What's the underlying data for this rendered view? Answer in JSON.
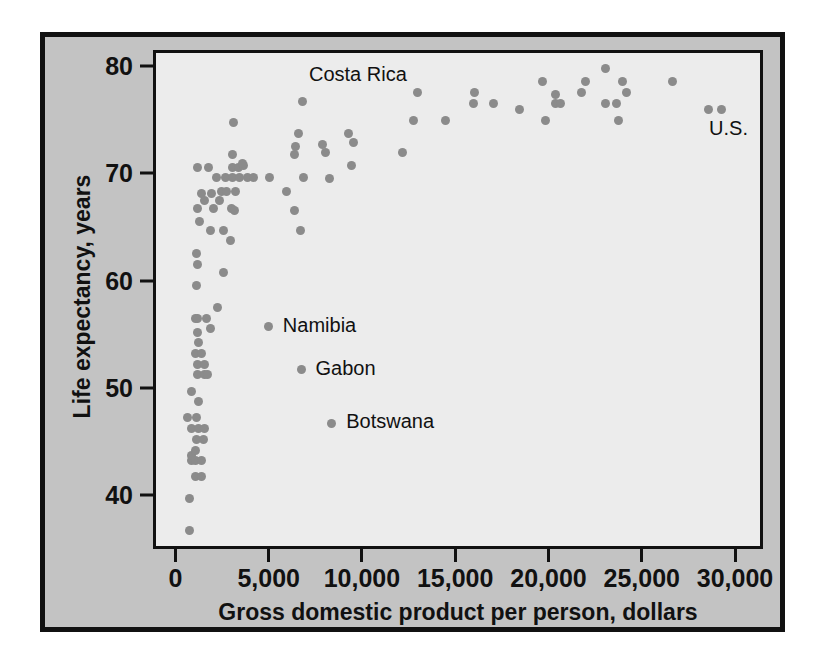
{
  "chart_data": {
    "type": "scatter",
    "title": "",
    "xlabel": "Gross domestic product per person, dollars",
    "ylabel": "Life expectancy, years",
    "xlim": [
      -1200,
      31500
    ],
    "ylim": [
      35.0,
      81.5
    ],
    "xticks": [
      0,
      5000,
      10000,
      15000,
      20000,
      25000,
      30000
    ],
    "xticklabels": [
      "0",
      "5,000",
      "10,000",
      "15,000",
      "20,000",
      "25,000",
      "30,000"
    ],
    "yticks": [
      40,
      50,
      60,
      70,
      80
    ],
    "yticklabels": [
      "40",
      "50",
      "60",
      "70",
      "80"
    ],
    "grid": false,
    "legend": null,
    "marker_color": "#8b8b8b",
    "plot_background": "#ececec",
    "figure_background": "#c3c3c3",
    "frame_color": "#111111",
    "points": [
      [
        600,
        37.0
      ],
      [
        620,
        40.0
      ],
      [
        900,
        42.0
      ],
      [
        1250,
        42.0
      ],
      [
        700,
        43.5
      ],
      [
        900,
        43.5
      ],
      [
        1250,
        43.5
      ],
      [
        720,
        44.0
      ],
      [
        900,
        44.5
      ],
      [
        950,
        45.5
      ],
      [
        1350,
        45.5
      ],
      [
        700,
        46.5
      ],
      [
        1100,
        46.5
      ],
      [
        1400,
        46.5
      ],
      [
        480,
        47.5
      ],
      [
        950,
        47.5
      ],
      [
        1100,
        49.0
      ],
      [
        700,
        50.0
      ],
      [
        1050,
        51.5
      ],
      [
        1400,
        51.5
      ],
      [
        1550,
        51.5
      ],
      [
        1050,
        52.5
      ],
      [
        1400,
        52.5
      ],
      [
        900,
        53.5
      ],
      [
        1250,
        53.5
      ],
      [
        1100,
        54.5
      ],
      [
        6600,
        52.0
      ],
      [
        1000,
        55.5
      ],
      [
        1700,
        55.8
      ],
      [
        900,
        56.8
      ],
      [
        1050,
        56.8
      ],
      [
        1500,
        56.8
      ],
      [
        4850,
        56.0
      ],
      [
        8200,
        47.0
      ],
      [
        2100,
        57.8
      ],
      [
        950,
        59.8
      ],
      [
        1000,
        61.8
      ],
      [
        950,
        62.8
      ],
      [
        2400,
        61.0
      ],
      [
        2800,
        64.0
      ],
      [
        1700,
        65.0
      ],
      [
        2400,
        65.0
      ],
      [
        6550,
        65.0
      ],
      [
        1150,
        65.8
      ],
      [
        1050,
        67.0
      ],
      [
        1900,
        67.0
      ],
      [
        2850,
        67.0
      ],
      [
        3000,
        66.8
      ],
      [
        6250,
        66.8
      ],
      [
        1400,
        67.8
      ],
      [
        2200,
        67.8
      ],
      [
        1250,
        68.4
      ],
      [
        1750,
        68.4
      ],
      [
        2300,
        68.6
      ],
      [
        2600,
        68.6
      ],
      [
        3050,
        68.6
      ],
      [
        5800,
        68.6
      ],
      [
        1050,
        70.8
      ],
      [
        1600,
        70.8
      ],
      [
        2900,
        70.8
      ],
      [
        3200,
        70.8
      ],
      [
        3500,
        71.0
      ],
      [
        3450,
        71.2
      ],
      [
        2050,
        69.9
      ],
      [
        2550,
        69.9
      ],
      [
        2900,
        69.9
      ],
      [
        3300,
        69.9
      ],
      [
        3700,
        69.9
      ],
      [
        4050,
        69.9
      ],
      [
        4900,
        69.9
      ],
      [
        6700,
        69.9
      ],
      [
        8100,
        69.8
      ],
      [
        2900,
        72.0
      ],
      [
        6250,
        72.0
      ],
      [
        7900,
        72.2
      ],
      [
        12000,
        72.2
      ],
      [
        9300,
        71.0
      ],
      [
        6300,
        72.8
      ],
      [
        7750,
        73.0
      ],
      [
        9400,
        73.2
      ],
      [
        6450,
        74.0
      ],
      [
        9100,
        74.0
      ],
      [
        2950,
        75.0
      ],
      [
        12600,
        75.2
      ],
      [
        14300,
        75.2
      ],
      [
        19700,
        75.2
      ],
      [
        23600,
        75.2
      ],
      [
        18300,
        76.2
      ],
      [
        20200,
        76.8
      ],
      [
        20500,
        76.8
      ],
      [
        16900,
        76.8
      ],
      [
        15800,
        76.8
      ],
      [
        22900,
        76.8
      ],
      [
        23500,
        76.8
      ],
      [
        28400,
        76.2
      ],
      [
        29100,
        76.2
      ],
      [
        6650,
        77.0
      ],
      [
        12800,
        77.8
      ],
      [
        15900,
        77.8
      ],
      [
        20200,
        77.6
      ],
      [
        21600,
        77.8
      ],
      [
        24000,
        77.8
      ],
      [
        19500,
        78.8
      ],
      [
        21800,
        78.8
      ],
      [
        23800,
        78.8
      ],
      [
        26500,
        78.8
      ],
      [
        22900,
        80.1
      ]
    ],
    "annotations": [
      {
        "label": "Costa Rica",
        "point": [
          6650,
          77.0
        ],
        "text_x": 7000,
        "text_y": 79.4
      },
      {
        "label": "Namibia",
        "point": [
          4850,
          56.0
        ],
        "text_x": 5600,
        "text_y": 56.0
      },
      {
        "label": "Gabon",
        "point": [
          6600,
          52.0
        ],
        "text_x": 7350,
        "text_y": 52.0
      },
      {
        "label": "Botswana",
        "point": [
          8200,
          47.0
        ],
        "text_x": 9000,
        "text_y": 47.0
      },
      {
        "label": "U.S.",
        "point": [
          29100,
          76.2
        ],
        "text_x": 28450,
        "text_y": 74.3
      }
    ]
  }
}
